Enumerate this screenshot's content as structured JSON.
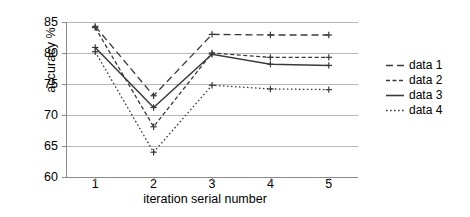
{
  "chart_data": {
    "type": "line",
    "title": "",
    "xlabel": "iteration serial number",
    "ylabel": "accuracy %",
    "x": [
      1,
      2,
      3,
      4,
      5
    ],
    "xtick_labels": [
      "1",
      "2",
      "3",
      "4",
      "5"
    ],
    "ytick_labels": [
      "60",
      "65",
      "70",
      "75",
      "80",
      "85"
    ],
    "ytick_values": [
      60,
      65,
      70,
      75,
      80,
      85
    ],
    "xlim": [
      0.5,
      5.5
    ],
    "ylim": [
      60,
      85
    ],
    "grid": "horizontal",
    "legend_position": "right",
    "marker": "plus",
    "series": [
      {
        "name": "data 1",
        "style": "dashed",
        "color": "#3a3a3a",
        "values": [
          84.3,
          73.1,
          83.0,
          82.9,
          82.9
        ]
      },
      {
        "name": "data 2",
        "style": "dash-dot",
        "color": "#3a3a3a",
        "values": [
          84.1,
          68.1,
          80.0,
          79.3,
          79.3
        ]
      },
      {
        "name": "data 3",
        "style": "solid",
        "color": "#3a3a3a",
        "values": [
          80.9,
          71.2,
          79.8,
          78.2,
          78.0
        ]
      },
      {
        "name": "data 4",
        "style": "dotted",
        "color": "#3a3a3a",
        "values": [
          80.2,
          64.0,
          74.8,
          74.2,
          74.1
        ]
      }
    ]
  },
  "legend": {
    "items": [
      {
        "label": "data 1"
      },
      {
        "label": "data 2"
      },
      {
        "label": "data 3"
      },
      {
        "label": "data 4"
      }
    ]
  }
}
